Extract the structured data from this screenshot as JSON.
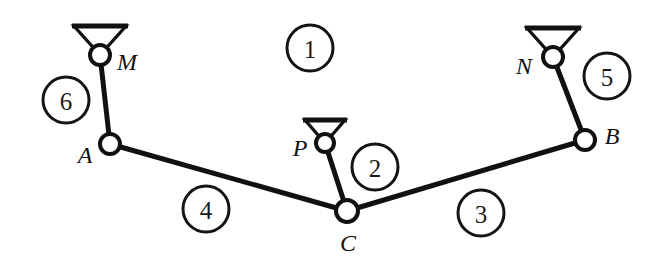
{
  "diagram": {
    "canvas": {
      "width": 663,
      "height": 269,
      "background": "#ffffff"
    },
    "stroke_color": "#111111",
    "joints": [
      {
        "id": "M",
        "label": "M",
        "x": 100,
        "y": 55,
        "radius": 10,
        "label_x": 127,
        "label_y": 62,
        "type": "grounded-pivot"
      },
      {
        "id": "A",
        "label": "A",
        "x": 110,
        "y": 144,
        "radius": 10,
        "label_x": 85,
        "label_y": 155,
        "type": "revolute"
      },
      {
        "id": "P",
        "label": "P",
        "x": 325,
        "y": 143,
        "radius": 9,
        "label_x": 300,
        "label_y": 148,
        "type": "grounded-pivot"
      },
      {
        "id": "C",
        "label": "C",
        "x": 347,
        "y": 211,
        "radius": 11,
        "label_x": 348,
        "label_y": 243,
        "type": "revolute"
      },
      {
        "id": "B",
        "label": "B",
        "x": 585,
        "y": 140,
        "radius": 10,
        "label_x": 612,
        "label_y": 136,
        "type": "revolute"
      },
      {
        "id": "N",
        "label": "N",
        "x": 553,
        "y": 57,
        "radius": 10,
        "label_x": 524,
        "label_y": 66,
        "type": "grounded-pivot"
      }
    ],
    "links": [
      {
        "id": "link-6",
        "from": "M",
        "to": "A"
      },
      {
        "id": "link-4",
        "from": "A",
        "to": "C"
      },
      {
        "id": "link-2",
        "from": "P",
        "to": "C"
      },
      {
        "id": "link-3",
        "from": "C",
        "to": "B"
      },
      {
        "id": "link-5",
        "from": "N",
        "to": "B"
      }
    ],
    "supports": [
      {
        "id": "support-M",
        "joint": "M",
        "half_width": 26,
        "height": 29
      },
      {
        "id": "support-P",
        "joint": "P",
        "half_width": 20,
        "height": 23
      },
      {
        "id": "support-N",
        "joint": "N",
        "half_width": 26,
        "height": 29
      }
    ],
    "link_numbers": [
      {
        "id": "number-1",
        "label": "1",
        "x": 310,
        "y": 48,
        "radius": 23
      },
      {
        "id": "number-6",
        "label": "6",
        "x": 66,
        "y": 100,
        "radius": 23
      },
      {
        "id": "number-2",
        "label": "2",
        "x": 375,
        "y": 167,
        "radius": 23
      },
      {
        "id": "number-5",
        "label": "5",
        "x": 607,
        "y": 76,
        "radius": 23
      },
      {
        "id": "number-4",
        "label": "4",
        "x": 206,
        "y": 209,
        "radius": 23
      },
      {
        "id": "number-3",
        "label": "3",
        "x": 481,
        "y": 213,
        "radius": 23
      }
    ]
  }
}
